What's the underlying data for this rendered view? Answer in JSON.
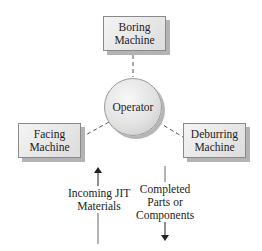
{
  "diagram": {
    "nodes": {
      "boring": {
        "line1": "Boring",
        "line2": "Machine"
      },
      "operator": {
        "label": "Operator"
      },
      "facing": {
        "line1": "Facing",
        "line2": "Machine"
      },
      "deburring": {
        "line1": "Deburring",
        "line2": "Machine"
      }
    },
    "flows": {
      "incoming": {
        "line1": "Incoming JIT",
        "line2": "Materials",
        "direction": "up"
      },
      "outgoing": {
        "line1": "Completed",
        "line2": "Parts or",
        "line3": "Components",
        "direction": "down"
      }
    },
    "edges": [
      {
        "from": "operator",
        "to": "boring",
        "style": "dashed"
      },
      {
        "from": "operator",
        "to": "facing",
        "style": "dashed"
      },
      {
        "from": "operator",
        "to": "deburring",
        "style": "dashed"
      }
    ],
    "colors": {
      "box_fill": "#e6e6e6",
      "box_border": "#8a8a8a",
      "shadow": "#b3b3b3",
      "line": "#444444"
    }
  }
}
